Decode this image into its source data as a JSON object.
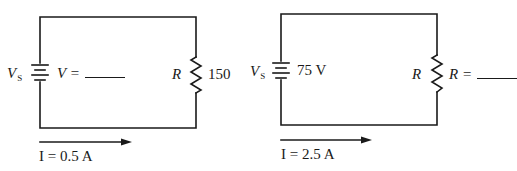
{
  "colors": {
    "wire": "#1a1a1a",
    "background": "#ffffff"
  },
  "circuits": [
    {
      "id": "left",
      "source": {
        "symbol": "V",
        "subscript": "S",
        "value_label": "V =",
        "value_blank": true
      },
      "resistor": {
        "symbol": "R",
        "value_label": "150",
        "value_blank": false
      },
      "current": {
        "label": "I = 0.5 A",
        "direction": "right"
      }
    },
    {
      "id": "right",
      "source": {
        "symbol": "V",
        "subscript": "S",
        "value_label": "75 V",
        "value_blank": false
      },
      "resistor": {
        "symbol": "R",
        "value_label": "R =",
        "value_blank": true
      },
      "current": {
        "label": "I = 2.5 A",
        "direction": "right"
      }
    }
  ],
  "icons": {
    "battery": "battery-icon",
    "resistor": "resistor-icon",
    "arrow": "current-arrow-icon"
  }
}
